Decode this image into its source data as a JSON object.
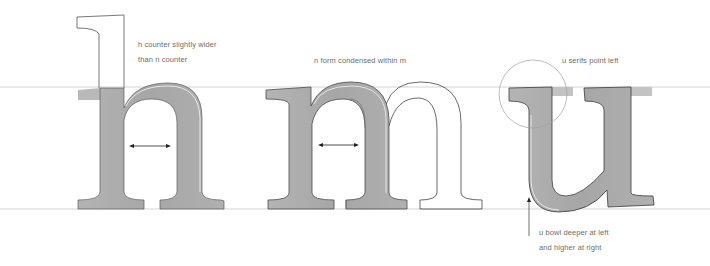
{
  "diagram": {
    "colors": {
      "guide_line": "#c8c8c8",
      "fill_grey": "#a9a9a9",
      "fill_grey_light": "#bdbdbd",
      "outline": "#3a3a3a",
      "outline_light": "#6a6a6a",
      "annotation_text": "#6e6e6e",
      "arrow": "#222222",
      "circle": "#a0a0a0"
    },
    "guides": {
      "x_height_y": 87,
      "baseline_y": 209
    },
    "letters": [
      {
        "glyph": "h",
        "label": "h"
      },
      {
        "glyph": "n",
        "label": "n (grey, over m)"
      },
      {
        "glyph": "m",
        "label": "m (outline)"
      },
      {
        "glyph": "u",
        "label": "u"
      }
    ],
    "annotations": {
      "h_counter": {
        "lines": [
          "h counter slightly wider",
          "than n counter"
        ],
        "x": 138,
        "y": 37
      },
      "n_form": {
        "lines": [
          "n form condensed within m"
        ],
        "x": 314,
        "y": 53
      },
      "u_serifs": {
        "lines": [
          "u serifs point left"
        ],
        "x": 562,
        "y": 53
      },
      "u_bowl": {
        "lines": [
          "u bowl deeper at left",
          "and higher at right"
        ],
        "x": 539,
        "y": 225
      }
    },
    "arrows": [
      {
        "name": "h-counter-width",
        "x1": 129,
        "x2": 171,
        "y": 146
      },
      {
        "name": "n-counter-width",
        "x1": 318,
        "x2": 359,
        "y": 145
      }
    ],
    "highlight_circle": {
      "cx": 533,
      "cy": 94,
      "r": 34
    }
  }
}
